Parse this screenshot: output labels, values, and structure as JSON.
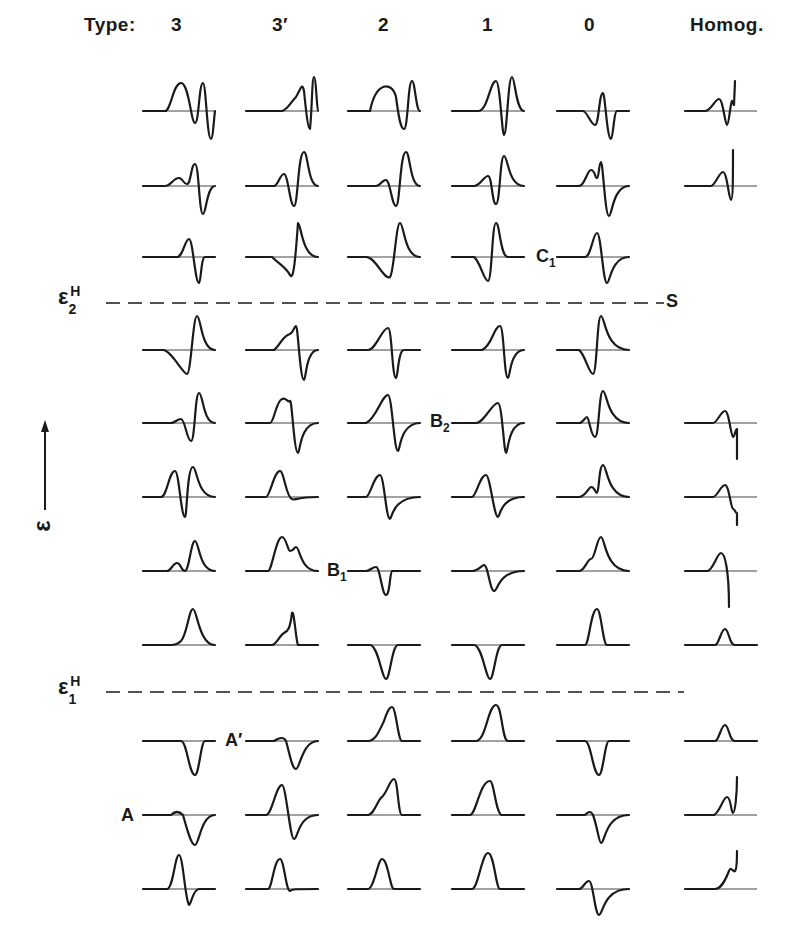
{
  "header": {
    "type_label": "Type:",
    "columns": [
      "3",
      "3′",
      "2",
      "1",
      "0",
      "Homog."
    ]
  },
  "labels": {
    "eps2": {
      "main": "ε",
      "sub": "2",
      "sup": "H"
    },
    "eps1": {
      "main": "ε",
      "sub": "1",
      "sup": "H"
    },
    "axis": "ε",
    "C1": {
      "main": "C",
      "sub": "1"
    },
    "S": "S",
    "B2": {
      "main": "B",
      "sub": "2"
    },
    "B1": {
      "main": "B",
      "sub": "1"
    },
    "A_prime": "A′",
    "A": "A"
  },
  "chart_data": {
    "type": "line",
    "xlabel": "Type",
    "ylabel": "ε (increasing upward)",
    "columns": [
      "3",
      "3′",
      "2",
      "1",
      "0",
      "Homog."
    ],
    "column_x": [
      143,
      246,
      348,
      452,
      557,
      685
    ],
    "row_y": [
      111,
      186,
      257,
      350,
      423,
      497,
      571,
      645,
      741,
      815,
      889
    ],
    "threshold_lines": [
      {
        "name": "ε₂ᴴ",
        "y": 303
      },
      {
        "name": "ε₁ᴴ",
        "y": 692
      }
    ],
    "annotations": [
      "C₁",
      "S",
      "B₂",
      "B₁",
      "A′",
      "A"
    ],
    "cells": [
      [
        0,
        0,
        "M0,0 L22,0 C28,0 30,-28 38,-28 C46,-28 48,12 52,12 C56,12 56,-28 60,-28 C63,-28 64,28 68,28 C70,28 71,6 72,0"
      ],
      [
        0,
        1,
        "M0,0 L36,0 C42,-2 44,-8 50,-14 C54,-20 56,-30 58,-20 C60,0 62,18 64,18 C66,0 66,-34 68,-34 C70,-34 71,0 72,0"
      ],
      [
        0,
        2,
        "M0,0 L22,0 C28,-30 44,-30 48,-14 C50,0 52,18 56,18 C60,18 60,-30 64,-30 C67,-30 68,0 72,0"
      ],
      [
        0,
        3,
        "M0,0 L26,0 C36,0 38,-30 44,-30 C48,-30 50,24 52,24 C55,24 56,-34 60,-34 C63,-34 64,0 72,0"
      ],
      [
        0,
        4,
        "M0,0 L26,0 C30,0 34,14 38,14 C42,14 42,-18 46,-18 C48,-18 50,28 54,28 C56,28 57,0 60,0 L72,0"
      ],
      [
        0,
        5,
        "M0,0 L20,0 C26,0 30,-12 34,-12 C38,-12 40,14 42,14 C44,14 45,-6 47,-10 L49,-6 L50,-30"
      ],
      [
        1,
        0,
        "M0,0 L22,0 C28,0 30,-8 36,-8 C40,-8 40,-2 44,-2 C48,-2 48,-22 52,-22 C56,-22 56,28 60,28 C63,28 64,0 72,0"
      ],
      [
        1,
        1,
        "M0,0 L28,0 C32,0 34,-12 38,-12 C42,-12 44,20 48,20 C52,20 52,-34 58,-34 C62,-34 62,0 72,0"
      ],
      [
        1,
        2,
        "M0,0 L28,0 C32,0 34,-6 38,-6 C42,-6 44,20 48,20 C52,20 52,-34 58,-34 C62,-34 62,0 72,0"
      ],
      [
        1,
        3,
        "M0,0 L22,0 C28,0 32,-10 36,-10 C40,-10 40,18 44,18 C48,18 48,-30 52,-30 C56,-30 56,0 72,0"
      ],
      [
        1,
        4,
        "M0,0 L22,0 C28,0 30,-16 34,-16 C38,-16 38,-8 40,-8 C42,-8 42,-24 44,-24 C46,-24 48,30 52,30 C55,30 56,0 72,0"
      ],
      [
        1,
        5,
        "M0,0 L26,0 C30,0 34,-14 38,-14 C42,-14 44,14 46,14 C48,14 48,-10 48,-36"
      ],
      [
        2,
        0,
        "M0,0 L34,0 C40,0 42,-18 46,-18 C50,-18 52,26 56,26 C58,26 58,0 62,0 L72,0"
      ],
      [
        2,
        1,
        "M0,0 L26,0 C32,6 40,10 44,18 C48,26 50,-8 52,-34 C55,-34 56,0 72,0"
      ],
      [
        2,
        2,
        "M0,0 L18,0 C28,0 36,24 42,20 C46,16 48,-34 52,-34 C56,-34 56,0 72,0"
      ],
      [
        2,
        3,
        "M0,0 L22,0 C28,4 32,24 36,24 C40,24 40,-34 44,-34 C48,-34 48,0 56,0 L72,0"
      ],
      [
        2,
        4,
        "M0,0 L28,0 C34,0 36,-24 40,-24 C44,-24 46,26 50,26 C53,26 54,0 72,0"
      ],
      [
        3,
        0,
        "M0,0 L20,0 C28,0 40,24 44,24 C48,24 50,-34 54,-34 C58,-34 58,0 72,0"
      ],
      [
        3,
        1,
        "M0,0 L28,0 C34,-4 36,-14 44,-16 C48,-18 48,-24 50,-24 C52,-24 54,30 58,30 C60,30 60,0 72,0"
      ],
      [
        3,
        2,
        "M0,0 L20,0 C28,0 34,-22 40,-22 C44,-22 44,28 48,28 C50,28 50,0 56,0 L72,0"
      ],
      [
        3,
        3,
        "M0,0 L30,0 C40,-4 42,-24 48,-24 C52,-24 52,28 56,28 C58,28 58,0 72,0"
      ],
      [
        3,
        4,
        "M0,0 L22,0 C28,4 32,24 36,24 C40,24 40,-34 44,-34 C48,-34 48,0 72,0"
      ],
      [
        4,
        0,
        "M0,0 L28,0 C32,0 34,-4 38,-4 C42,-4 44,18 48,18 C52,18 52,-30 56,-30 C60,-30 60,0 72,0"
      ],
      [
        4,
        1,
        "M0,0 L24,0 C28,0 30,-22 36,-24 C40,-26 42,-20 44,-22 C46,-24 48,30 52,30 C54,30 54,0 72,0"
      ],
      [
        4,
        2,
        "M0,0 L18,0 C28,-4 34,-28 40,-28 C44,-28 46,28 50,28 C52,28 52,0 72,0"
      ],
      [
        4,
        3,
        "M0,0 L24,0 C32,0 40,-20 46,-20 C50,-20 52,30 54,30 C56,30 56,0 72,0"
      ],
      [
        4,
        4,
        "M0,0 L22,0 C26,0 28,-6 30,-6 C32,-6 34,14 38,14 C42,14 42,-32 46,-32 C50,-32 50,0 72,0"
      ],
      [
        4,
        5,
        "M0,0 L28,0 C32,0 36,-12 40,-12 C44,-12 46,14 48,14 C50,14 50,6 52,6 L52,36"
      ],
      [
        5,
        0,
        "M0,0 L18,0 C24,0 26,-26 32,-26 C36,-26 38,20 42,20 C44,20 44,-30 50,-30 C54,-30 54,0 72,0"
      ],
      [
        5,
        1,
        "M0,0 L20,0 C24,0 28,-26 34,-26 C38,-26 40,0 46,2 C48,4 50,0 72,0"
      ],
      [
        5,
        2,
        "M0,0 L18,0 C22,0 26,-22 32,-22 C36,-22 38,22 42,22 C44,22 44,0 72,0"
      ],
      [
        5,
        3,
        "M0,0 L20,0 C24,0 28,-22 34,-22 C38,-22 42,20 46,20 C48,20 48,0 72,0"
      ],
      [
        5,
        4,
        "M0,0 L22,0 C28,0 32,-10 34,-10 C38,-10 38,-4 40,-4 C42,-4 42,-32 46,-32 C50,-32 50,0 72,0"
      ],
      [
        5,
        5,
        "M0,0 L28,0 C32,0 36,-12 40,-12 C44,-12 46,12 48,12 C50,12 50,16 52,16 L52,28"
      ],
      [
        6,
        0,
        "M0,0 L24,0 C28,0 30,-8 34,-8 C38,-8 38,0 42,0 C46,0 48,-30 52,-30 C56,-30 56,0 72,0"
      ],
      [
        6,
        1,
        "M0,0 L22,0 C26,0 30,-34 36,-34 C40,-34 42,-20 44,-20 C48,-20 48,-24 50,-24 C54,-24 54,0 72,0"
      ],
      [
        6,
        2,
        "M0,0 L18,0 C22,0 24,-4 28,-4 C32,-4 34,24 38,24 C42,24 42,0 44,0 L72,0"
      ],
      [
        6,
        3,
        "M0,0 L20,0 C26,0 30,-6 32,-6 C36,-6 38,20 42,20 C46,20 46,0 72,0"
      ],
      [
        6,
        4,
        "M0,0 L22,0 C28,0 30,-12 34,-12 C38,-12 40,-34 44,-34 C48,-34 48,0 72,0"
      ],
      [
        6,
        5,
        "M0,0 L22,0 C28,0 32,-18 36,-18 C40,-18 44,0 44,36"
      ],
      [
        7,
        0,
        "M0,0 L28,0 C34,0 36,-2 38,-4 C44,-10 46,-36 50,-36 C54,-36 56,0 72,0"
      ],
      [
        7,
        1,
        "M0,0 L26,0 C30,0 34,-10 38,-12 C42,-14 44,-16 46,-32 C48,-36 50,-4 52,0 L72,0"
      ],
      [
        7,
        2,
        "M0,0 L22,0 C30,0 34,34 38,34 C42,34 44,0 50,0 L72,0"
      ],
      [
        7,
        3,
        "M0,0 L22,0 C30,0 34,34 38,34 C42,34 44,0 50,0 L72,0"
      ],
      [
        7,
        4,
        "M0,0 L28,0 C32,0 34,-36 40,-36 C44,-36 46,0 50,0 L72,0"
      ],
      [
        7,
        5,
        "M0,0 L30,0 C34,0 36,-16 40,-16 C44,-16 44,0 50,0 L72,0"
      ],
      [
        8,
        0,
        "M0,0 L38,0 C44,0 46,34 52,34 C56,34 58,0 62,0 L72,0"
      ],
      [
        8,
        1,
        "M0,0 L28,0 C34,-4 38,-4 40,0 C44,14 46,28 50,28 C54,28 56,0 72,0"
      ],
      [
        8,
        2,
        "M0,0 L20,0 C28,0 32,-12 36,-20 C40,-32 42,-34 44,-34 C48,-34 50,0 54,0 L72,0"
      ],
      [
        8,
        3,
        "M0,0 L24,0 C34,0 36,-36 44,-36 C50,-36 50,0 56,0 L72,0"
      ],
      [
        8,
        4,
        "M0,0 L28,0 C34,0 36,34 42,34 C46,34 48,0 52,0 L72,0"
      ],
      [
        8,
        5,
        "M0,0 L30,0 C34,0 36,-16 40,-16 C44,-16 44,0 50,0 L72,0"
      ],
      [
        9,
        0,
        "M0,0 L28,0 C32,-4 36,-4 40,0 C44,14 48,30 52,30 C56,30 58,0 72,0"
      ],
      [
        9,
        1,
        "M0,0 L20,0 C26,0 30,-30 36,-30 C40,-30 44,24 48,24 C52,24 52,0 72,0"
      ],
      [
        9,
        2,
        "M0,0 L20,0 C26,0 30,-16 34,-18 C40,-24 42,-36 46,-36 C50,-36 50,0 54,0 L72,0"
      ],
      [
        9,
        3,
        "M0,0 L18,0 C24,0 28,-34 38,-34 C42,-34 44,0 50,0 L72,0"
      ],
      [
        9,
        4,
        "M0,0 L28,0 C32,-4 34,-4 36,0 C40,10 42,28 44,28 C48,28 48,0 72,0"
      ],
      [
        9,
        5,
        "M0,0 L28,0 C34,0 38,-18 42,-18 C46,-18 46,-2 48,-2 C50,-2 52,-20 52,-38"
      ],
      [
        10,
        0,
        "M0,0 L24,0 C30,0 32,-34 36,-34 C40,-34 42,10 46,16 C48,16 50,0 56,0 L72,0"
      ],
      [
        10,
        1,
        "M0,0 L22,0 C26,0 28,-30 34,-30 C38,-30 40,2 44,2 C46,0 48,0 72,0"
      ],
      [
        10,
        2,
        "M0,0 L20,0 C26,0 30,-30 34,-30 C40,-30 42,0 46,0 L72,0"
      ],
      [
        10,
        3,
        "M0,0 L20,0 C26,0 30,-36 36,-36 C42,-36 44,0 48,0 L72,0"
      ],
      [
        10,
        4,
        "M0,0 L22,0 C26,0 28,-8 32,-8 C36,-8 38,26 42,26 C46,26 46,0 72,0"
      ],
      [
        10,
        5,
        "M0,0 L30,0 C36,0 40,-8 44,-18 C46,-24 48,-16 50,-18 C52,-20 52,-28 52,-38"
      ]
    ]
  }
}
